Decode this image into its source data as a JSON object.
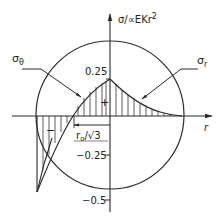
{
  "diagram": {
    "axes": {
      "y_label": "σ/αEKr²",
      "y_label_main": "σ/∝EKr",
      "y_label_sup": "2",
      "x_label": "r",
      "ticks": [
        {
          "value": 0.25,
          "label": "0.25"
        },
        {
          "value": -0.25,
          "label": "−0.25"
        },
        {
          "value": -0.5,
          "label": "−0.5"
        }
      ]
    },
    "curves": [
      {
        "name": "sigma_theta",
        "label_main": "σ",
        "label_sub": "θ"
      },
      {
        "name": "sigma_r",
        "label_main": "σ",
        "label_sub": "r"
      }
    ],
    "regions": {
      "positive_sign": "+",
      "negative_sign": "−"
    },
    "dimension": {
      "label_main": "r",
      "label_sub": "o",
      "label_rest": "/√3"
    },
    "colors": {
      "line": "#2a2a2a",
      "background": "#ffffff"
    }
  }
}
